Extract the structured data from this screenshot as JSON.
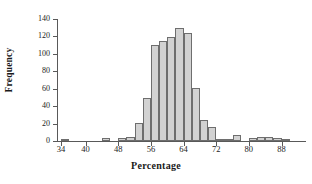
{
  "chart_data": {
    "type": "bar",
    "title": "",
    "subtitle": "",
    "xlabel": "Percentage",
    "ylabel": "Frequency",
    "xlim": [
      33,
      94
    ],
    "ylim": [
      0,
      140
    ],
    "bin_width": 2,
    "grid": false,
    "legend": null,
    "annotations": [],
    "x_tick_labels": [
      "34",
      "40",
      "48",
      "56",
      "64",
      "72",
      "80",
      "88"
    ],
    "x_tick_values": [
      34,
      40,
      48,
      56,
      64,
      72,
      80,
      88
    ],
    "y_tick_labels": [
      "0",
      "20",
      "40",
      "60",
      "80",
      "100",
      "120",
      "140"
    ],
    "y_tick_values": [
      0,
      20,
      40,
      60,
      80,
      100,
      120,
      140
    ],
    "bar_color": "#d2d2d2",
    "bar_edge_color": "#6e6e6e",
    "axis_color": "#595959",
    "bins": [
      {
        "start": 34,
        "end": 36,
        "value": 2
      },
      {
        "start": 36,
        "end": 38,
        "value": 0
      },
      {
        "start": 38,
        "end": 40,
        "value": 0
      },
      {
        "start": 40,
        "end": 42,
        "value": 0
      },
      {
        "start": 42,
        "end": 44,
        "value": 0
      },
      {
        "start": 44,
        "end": 46,
        "value": 3
      },
      {
        "start": 46,
        "end": 48,
        "value": 0
      },
      {
        "start": 48,
        "end": 50,
        "value": 3
      },
      {
        "start": 50,
        "end": 52,
        "value": 5
      },
      {
        "start": 52,
        "end": 54,
        "value": 21
      },
      {
        "start": 54,
        "end": 56,
        "value": 49
      },
      {
        "start": 56,
        "end": 58,
        "value": 110
      },
      {
        "start": 58,
        "end": 60,
        "value": 115
      },
      {
        "start": 60,
        "end": 62,
        "value": 119
      },
      {
        "start": 62,
        "end": 64,
        "value": 130
      },
      {
        "start": 64,
        "end": 66,
        "value": 124
      },
      {
        "start": 66,
        "end": 68,
        "value": 61
      },
      {
        "start": 68,
        "end": 70,
        "value": 24
      },
      {
        "start": 70,
        "end": 72,
        "value": 16
      },
      {
        "start": 72,
        "end": 74,
        "value": 1
      },
      {
        "start": 74,
        "end": 76,
        "value": 1
      },
      {
        "start": 76,
        "end": 78,
        "value": 7
      },
      {
        "start": 78,
        "end": 80,
        "value": 0
      },
      {
        "start": 80,
        "end": 82,
        "value": 4
      },
      {
        "start": 82,
        "end": 84,
        "value": 5
      },
      {
        "start": 84,
        "end": 86,
        "value": 5
      },
      {
        "start": 86,
        "end": 88,
        "value": 4
      },
      {
        "start": 88,
        "end": 90,
        "value": 1
      },
      {
        "start": 90,
        "end": 92,
        "value": 0
      },
      {
        "start": 92,
        "end": 94,
        "value": 0
      }
    ],
    "categories": [
      "34-36",
      "36-38",
      "38-40",
      "40-42",
      "42-44",
      "44-46",
      "46-48",
      "48-50",
      "50-52",
      "52-54",
      "54-56",
      "56-58",
      "58-60",
      "60-62",
      "62-64",
      "64-66",
      "66-68",
      "68-70",
      "70-72",
      "72-74",
      "74-76",
      "76-78",
      "78-80",
      "80-82",
      "82-84",
      "84-86",
      "86-88",
      "88-90",
      "90-92",
      "92-94"
    ],
    "values": [
      2,
      0,
      0,
      0,
      0,
      3,
      0,
      3,
      5,
      21,
      49,
      110,
      115,
      119,
      130,
      124,
      61,
      24,
      16,
      1,
      1,
      7,
      0,
      4,
      5,
      5,
      4,
      1,
      0,
      0
    ]
  }
}
